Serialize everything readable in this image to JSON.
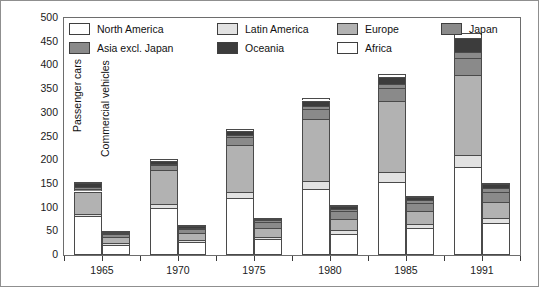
{
  "chart_data": {
    "type": "bar",
    "title": "",
    "subtitle": "",
    "xlabel": "",
    "ylabel": "",
    "stacked": true,
    "grid": false,
    "legend_position": "top-inside",
    "ylim": [
      0,
      500
    ],
    "ytick_step": 50,
    "ytick_labels": [
      "500",
      "450",
      "400",
      "350",
      "300",
      "250",
      "200",
      "150",
      "100",
      "50",
      "0"
    ],
    "ytick_values": [
      500,
      450,
      400,
      350,
      300,
      250,
      200,
      150,
      100,
      50,
      0
    ],
    "categories": [
      "1965",
      "1970",
      "1975",
      "1980",
      "1985",
      "1991"
    ],
    "group_labels": [
      "Passenger cars",
      "Commercial vehicles"
    ],
    "legend": [
      {
        "label": "North America",
        "color": "#ffffff"
      },
      {
        "label": "Latin America",
        "color": "#e2e2e2"
      },
      {
        "label": "Europe",
        "color": "#b2b2b2"
      },
      {
        "label": "Japan",
        "color": "#8a8a8a"
      },
      {
        "label": "Asia excl. Japan",
        "color": "#8a8a8a"
      },
      {
        "label": "Oceania",
        "color": "#3c3c3c"
      },
      {
        "label": "Africa",
        "color": "#ffffff"
      }
    ],
    "series_order": [
      "North America",
      "Latin America",
      "Europe",
      "Japan",
      "Asia excl. Japan",
      "Oceania",
      "Africa"
    ],
    "groups": [
      {
        "name": "Passenger cars",
        "totals": [
          154,
          202,
          266,
          331,
          381,
          468
        ],
        "series": [
          {
            "name": "North America",
            "values": [
              82,
              100,
              120,
              140,
              155,
              185
            ]
          },
          {
            "name": "Latin America",
            "values": [
              4,
              8,
              12,
              16,
              20,
              25
            ]
          },
          {
            "name": "Europe",
            "values": [
              48,
              72,
              100,
              130,
              150,
              170
            ]
          },
          {
            "name": "Japan",
            "values": [
              6,
              9,
              16,
              22,
              27,
              36
            ]
          },
          {
            "name": "Asia excl. Japan",
            "values": [
              4,
              4,
              5,
              7,
              9,
              13
            ]
          },
          {
            "name": "Oceania",
            "values": [
              7,
              6,
              9,
              11,
              14,
              29
            ]
          },
          {
            "name": "Africa",
            "values": [
              3,
              3,
              4,
              5,
              6,
              10
            ]
          }
        ]
      },
      {
        "name": "Commercial vehicles",
        "totals": [
          50,
          62,
          78,
          104,
          124,
          152
        ],
        "series": [
          {
            "name": "North America",
            "values": [
              22,
              27,
              33,
              44,
              56,
              68
            ]
          },
          {
            "name": "Latin America",
            "values": [
              4,
              5,
              6,
              8,
              9,
              11
            ]
          },
          {
            "name": "Europe",
            "values": [
              11,
              14,
              18,
              24,
              27,
              32
            ]
          },
          {
            "name": "Japan",
            "values": [
              7,
              9,
              12,
              16,
              18,
              21
            ]
          },
          {
            "name": "Asia excl. Japan",
            "values": [
              3,
              3,
              4,
              6,
              7,
              10
            ]
          },
          {
            "name": "Oceania",
            "values": [
              2,
              3,
              4,
              5,
              6,
              8
            ]
          },
          {
            "name": "Africa",
            "values": [
              1,
              1,
              1,
              1,
              1,
              2
            ]
          }
        ]
      }
    ]
  }
}
